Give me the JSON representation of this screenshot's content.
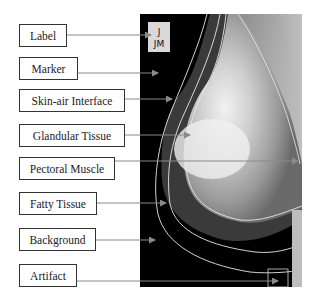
{
  "diagram": {
    "labels": [
      {
        "id": "label",
        "text": "Label"
      },
      {
        "id": "marker",
        "text": "Marker"
      },
      {
        "id": "skin-air-interface",
        "text": "Skin-air Interface"
      },
      {
        "id": "glandular-tissue",
        "text": "Glandular Tissue"
      },
      {
        "id": "pectoral-muscle",
        "text": "Pectoral Muscle"
      },
      {
        "id": "fatty-tissue",
        "text": "Fatty Tissue"
      },
      {
        "id": "background",
        "text": "Background"
      },
      {
        "id": "artifact",
        "text": "Artifact"
      }
    ],
    "image_tag": {
      "line1": "J",
      "line2": "JM"
    },
    "colors": {
      "box_border": "#333333",
      "arrow": "#7a7a7a",
      "contour": "#e8e8e8",
      "background": "#000000"
    }
  }
}
